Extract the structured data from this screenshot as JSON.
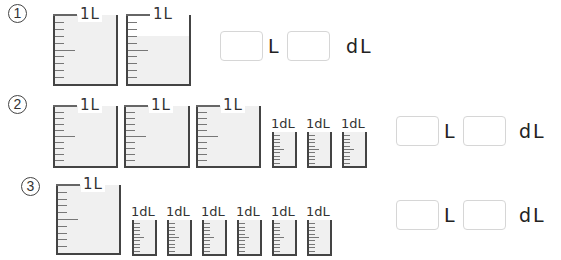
{
  "problems": [
    {
      "number": "1",
      "number_glyph": "①",
      "containers": [
        {
          "type": "liter",
          "label": "1L",
          "fill_fraction": 1.0
        },
        {
          "type": "liter",
          "label": "1L",
          "fill_fraction": 0.7
        }
      ],
      "answer": {
        "liters_value": "",
        "liters_unit": "L",
        "deciliters_value": "",
        "deciliters_unit": "dL"
      }
    },
    {
      "number": "2",
      "number_glyph": "②",
      "containers": [
        {
          "type": "liter",
          "label": "1L",
          "fill_fraction": 1.0
        },
        {
          "type": "liter",
          "label": "1L",
          "fill_fraction": 1.0
        },
        {
          "type": "liter",
          "label": "1L",
          "fill_fraction": 1.0
        },
        {
          "type": "deciliter",
          "label": "1dL",
          "fill_fraction": 1.0
        },
        {
          "type": "deciliter",
          "label": "1dL",
          "fill_fraction": 1.0
        },
        {
          "type": "deciliter",
          "label": "1dL",
          "fill_fraction": 1.0
        }
      ],
      "answer": {
        "liters_value": "",
        "liters_unit": "L",
        "deciliters_value": "",
        "deciliters_unit": "dL"
      }
    },
    {
      "number": "3",
      "number_glyph": "③",
      "containers": [
        {
          "type": "liter",
          "label": "1L",
          "fill_fraction": 1.0
        },
        {
          "type": "deciliter",
          "label": "1dL",
          "fill_fraction": 1.0
        },
        {
          "type": "deciliter",
          "label": "1dL",
          "fill_fraction": 1.0
        },
        {
          "type": "deciliter",
          "label": "1dL",
          "fill_fraction": 1.0
        },
        {
          "type": "deciliter",
          "label": "1dL",
          "fill_fraction": 1.0
        },
        {
          "type": "deciliter",
          "label": "1dL",
          "fill_fraction": 1.0
        },
        {
          "type": "deciliter",
          "label": "1dL",
          "fill_fraction": 1.0
        }
      ],
      "answer": {
        "liters_value": "",
        "liters_unit": "L",
        "deciliters_value": "",
        "deciliters_unit": "dL"
      }
    }
  ],
  "colors": {
    "fill": "#f0f0f0",
    "outline": "#444444",
    "answer_box_border": "#d6d6d6"
  }
}
